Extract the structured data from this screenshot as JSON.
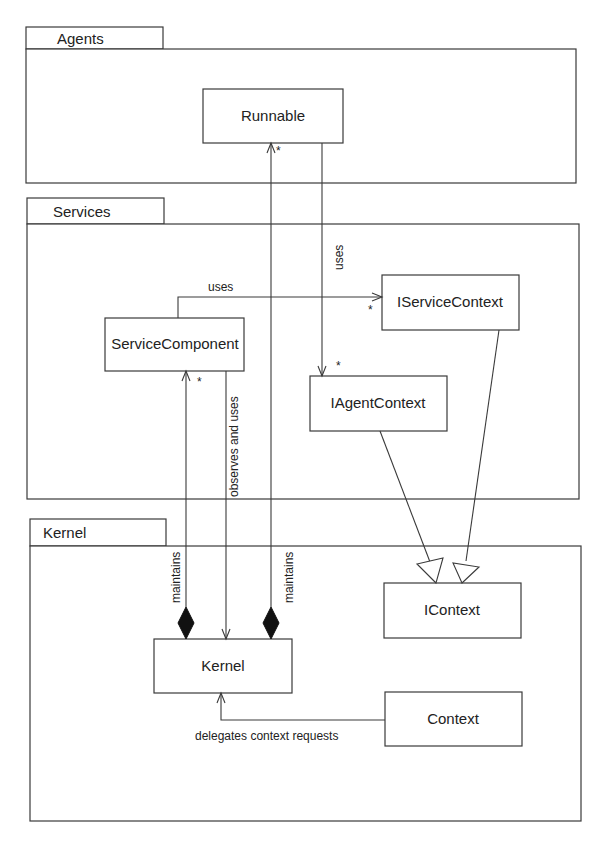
{
  "packages": [
    {
      "id": "agents",
      "label": "Agents"
    },
    {
      "id": "services",
      "label": "Services"
    },
    {
      "id": "kernel",
      "label": "Kernel"
    }
  ],
  "classes": {
    "runnable": "Runnable",
    "service_component": "ServiceComponent",
    "iservice_context": "IServiceContext",
    "iagent_context": "IAgentContext",
    "icontext": "IContext",
    "kernel": "Kernel",
    "context": "Context"
  },
  "relations": {
    "runnable_uses_iagentcontext": {
      "label": "uses",
      "multiplicity": "*"
    },
    "servicecomponent_uses_iservicecontext": {
      "label": "uses",
      "multiplicity": "*"
    },
    "servicecomponent_observes_kernel": {
      "label": "observes and uses"
    },
    "kernel_maintains_servicecomponent": {
      "label": "maintains",
      "multiplicity": "*"
    },
    "kernel_maintains_runnable": {
      "label": "maintains",
      "multiplicity": "*"
    },
    "iagentcontext_extends_icontext": {
      "label": ""
    },
    "iservicecontext_extends_icontext": {
      "label": ""
    },
    "context_delegates_kernel": {
      "label": "delegates context requests"
    }
  }
}
